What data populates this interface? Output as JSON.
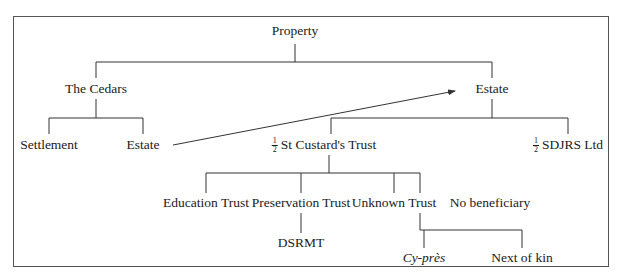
{
  "diagram": {
    "type": "tree",
    "root": "Property",
    "nodes": {
      "property": {
        "label": "Property"
      },
      "the_cedars": {
        "label": "The Cedars"
      },
      "settlement": {
        "label": "Settlement"
      },
      "estate_left": {
        "label": "Estate"
      },
      "estate_right": {
        "label": "Estate"
      },
      "st_custards": {
        "fraction_num": "1",
        "fraction_den": "2",
        "label": "St Custard's Trust"
      },
      "sdjrs": {
        "fraction_num": "1",
        "fraction_den": "2",
        "label": "SDJRS Ltd"
      },
      "education_trust": {
        "label": "Education Trust"
      },
      "preservation_trust": {
        "label": "Preservation Trust"
      },
      "unknown_trust": {
        "label": "Unknown Trust"
      },
      "no_beneficiary": {
        "label": "No beneficiary"
      },
      "dsrmt": {
        "label": "DSRMT"
      },
      "cy_pres": {
        "label": "Cy-près"
      },
      "next_of_kin": {
        "label": "Next of kin"
      }
    },
    "edges": [
      [
        "Property",
        "The Cedars"
      ],
      [
        "Property",
        "Estate"
      ],
      [
        "The Cedars",
        "Settlement"
      ],
      [
        "The Cedars",
        "Estate"
      ],
      [
        "Estate",
        "1/2 St Custard's Trust"
      ],
      [
        "Estate",
        "1/2 SDJRS Ltd"
      ],
      [
        "1/2 St Custard's Trust",
        "Education Trust"
      ],
      [
        "1/2 St Custard's Trust",
        "Preservation Trust"
      ],
      [
        "1/2 St Custard's Trust",
        "Unknown Trust"
      ],
      [
        "1/2 St Custard's Trust",
        "No beneficiary"
      ],
      [
        "Preservation Trust",
        "DSRMT"
      ],
      [
        "No beneficiary",
        "Cy-près"
      ],
      [
        "No beneficiary",
        "Next of kin"
      ]
    ],
    "arrows": [
      {
        "from": "Estate (The Cedars)",
        "to": "Estate"
      }
    ],
    "colors": {
      "line": "#333333",
      "frame": "#555555",
      "text": "#1a1a1a"
    }
  }
}
